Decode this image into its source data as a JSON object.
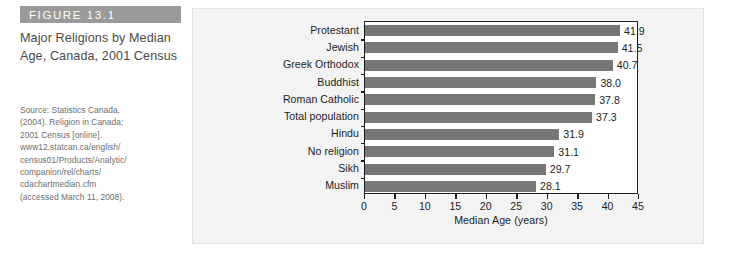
{
  "figure": {
    "header_label": "FIGURE 13.1",
    "title": "Major Religions by Median Age, Canada, 2001 Census",
    "source_lines": [
      "Source: Statistics Canada.",
      "(2004). Religion in Canada:",
      "2001 Census [online].",
      "www12.statcan.ca/english/",
      "census01/Products/Analytic/",
      "companion/rel/charts/",
      "cdachartmedian.cfm",
      "(accessed March 11, 2008)."
    ],
    "header_bar_color": "#9a9a9a",
    "panel_color": "#f3f3f3",
    "bar_color": "#777777",
    "axis_color": "#1d1d1d"
  },
  "chart_data": {
    "type": "bar",
    "orientation": "horizontal",
    "title": "",
    "xlabel": "Median Age (years)",
    "ylabel": "",
    "xlim": [
      0,
      45
    ],
    "xticks": [
      0,
      5,
      10,
      15,
      20,
      25,
      30,
      35,
      40,
      45
    ],
    "xtick_labels": [
      "0",
      "5",
      "10",
      "15",
      "20",
      "25",
      "30",
      "35",
      "40",
      "45"
    ],
    "grid": false,
    "legend": false,
    "categories": [
      "Protestant",
      "Jewish",
      "Greek Orthodox",
      "Buddhist",
      "Roman Catholic",
      "Total population",
      "Hindu",
      "No religion",
      "Sikh",
      "Muslim"
    ],
    "values": [
      41.9,
      41.5,
      40.7,
      38.0,
      37.8,
      37.3,
      31.9,
      31.1,
      29.7,
      28.1
    ],
    "value_labels": [
      "41.9",
      "41.5",
      "40.7",
      "38.0",
      "37.8",
      "37.3",
      "31.9",
      "31.1",
      "29.7",
      "28.1"
    ]
  }
}
